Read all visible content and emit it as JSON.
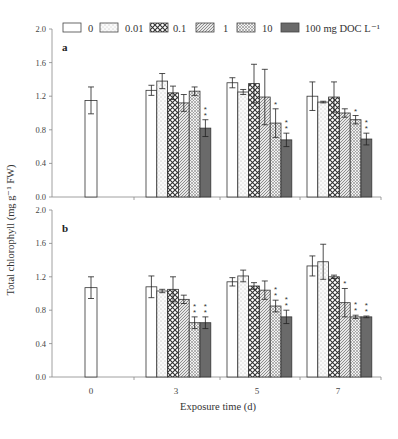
{
  "chart_data": {
    "type": "bar",
    "ylabel": "Total chlorophyll (mg g⁻¹ FW)",
    "xlabel": "Exposure time (d)",
    "categories": [
      "0",
      "3",
      "5",
      "7"
    ],
    "ylim": [
      0.0,
      2.0
    ],
    "yticks": [
      "0.0",
      "0.4",
      "0.8",
      "1.2",
      "1.6",
      "2.0"
    ],
    "grid": false,
    "legend_position": "top",
    "legend": [
      {
        "label": "0",
        "pattern": "white"
      },
      {
        "label": "0.01",
        "pattern": "dots"
      },
      {
        "label": "0.1",
        "pattern": "crosshatch"
      },
      {
        "label": "1",
        "pattern": "diagonal"
      },
      {
        "label": "10",
        "pattern": "fine-crosshatch"
      },
      {
        "label": "100 mg DOC L⁻¹",
        "pattern": "dark"
      }
    ],
    "panels": [
      {
        "label": "a",
        "control": {
          "value": 1.15,
          "err": 0.16
        },
        "groups": [
          {
            "day": "3",
            "values": [
              1.27,
              1.38,
              1.24,
              1.12,
              1.26,
              0.82
            ],
            "errors": [
              0.06,
              0.09,
              0.08,
              0.1,
              0.05,
              0.1
            ],
            "stars": [
              "",
              "",
              "",
              "",
              "",
              "**"
            ]
          },
          {
            "day": "5",
            "values": [
              1.36,
              1.25,
              1.35,
              1.19,
              0.88,
              0.68
            ],
            "errors": [
              0.06,
              0.03,
              0.23,
              0.33,
              0.17,
              0.08
            ],
            "stars": [
              "",
              "",
              "",
              "",
              "*",
              "**"
            ]
          },
          {
            "day": "7",
            "values": [
              1.2,
              1.13,
              1.19,
              1.0,
              0.92,
              0.69
            ],
            "errors": [
              0.17,
              0.01,
              0.18,
              0.05,
              0.05,
              0.07
            ],
            "stars": [
              "",
              "",
              "",
              "",
              "*",
              "**"
            ]
          }
        ]
      },
      {
        "label": "b",
        "control": {
          "value": 1.07,
          "err": 0.13
        },
        "groups": [
          {
            "day": "3",
            "values": [
              1.08,
              1.03,
              1.05,
              0.93,
              0.65,
              0.65
            ],
            "errors": [
              0.13,
              0.02,
              0.15,
              0.05,
              0.07,
              0.07
            ],
            "stars": [
              "",
              "",
              "",
              "",
              "**",
              "**"
            ]
          },
          {
            "day": "5",
            "values": [
              1.14,
              1.21,
              1.09,
              1.04,
              0.85,
              0.72
            ],
            "errors": [
              0.05,
              0.07,
              0.04,
              0.11,
              0.07,
              0.08
            ],
            "stars": [
              "",
              "",
              "",
              "",
              "**",
              "**"
            ]
          },
          {
            "day": "7",
            "values": [
              1.33,
              1.38,
              1.2,
              0.89,
              0.72,
              0.72
            ],
            "errors": [
              0.12,
              0.21,
              0.02,
              0.17,
              0.02,
              0.01
            ],
            "stars": [
              "",
              "",
              "",
              "*",
              "**",
              "**"
            ]
          }
        ]
      }
    ]
  }
}
